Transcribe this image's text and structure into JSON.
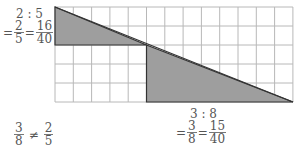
{
  "diagram": {
    "grid": {
      "cols": 13,
      "rows": 5,
      "x0": 55,
      "y0": 7,
      "cell_w": 18.3,
      "cell_h": 19.0
    },
    "colors": {
      "fill": "#9e9e9e",
      "grid": "#b8b8b8",
      "outline": "#333333"
    }
  },
  "left_label": {
    "ratio": "2 : 5",
    "eq1": "=",
    "f1_num": "2",
    "f1_den": "5",
    "eq2": "=",
    "f2_num": "16",
    "f2_den": "40"
  },
  "right_label": {
    "ratio": "3 : 8",
    "eq1": "=",
    "f1_num": "3",
    "f1_den": "8",
    "eq2": "=",
    "f2_num": "15",
    "f2_den": "40"
  },
  "conclusion": {
    "f1_num": "3",
    "f1_den": "8",
    "neq": "≠",
    "f2_num": "2",
    "f2_den": "5"
  }
}
